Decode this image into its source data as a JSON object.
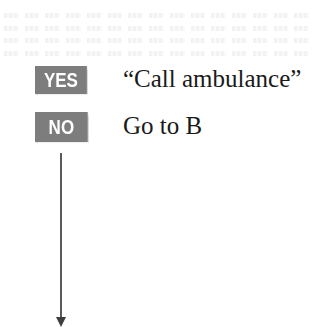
{
  "diagram": {
    "branches": [
      {
        "badge": "YES",
        "action": "“Call ambulance”"
      },
      {
        "badge": "NO",
        "action": "Go to B"
      }
    ],
    "connector": {
      "direction": "down",
      "from": "NO"
    }
  },
  "colors": {
    "badge_bg": "#7d7d7d",
    "badge_text": "#ffffff",
    "text": "#1a1a1a",
    "line": "#5a5a5a"
  }
}
